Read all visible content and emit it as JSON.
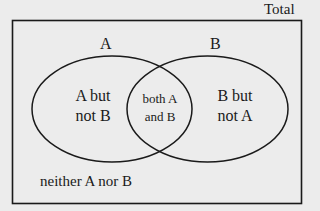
{
  "diagram": {
    "type": "venn",
    "universe_label": "Total",
    "sets": [
      {
        "name": "A",
        "label": "A"
      },
      {
        "name": "B",
        "label": "B"
      }
    ],
    "regions": {
      "a_only": {
        "line1": "A but",
        "line2": "not B"
      },
      "both": {
        "line1": "both A",
        "line2": "and B"
      },
      "b_only": {
        "line1": "B but",
        "line2": "not A"
      },
      "neither": "neither A nor B"
    },
    "colors": {
      "stroke": "#1a1a1a",
      "background": "#ececec"
    }
  }
}
